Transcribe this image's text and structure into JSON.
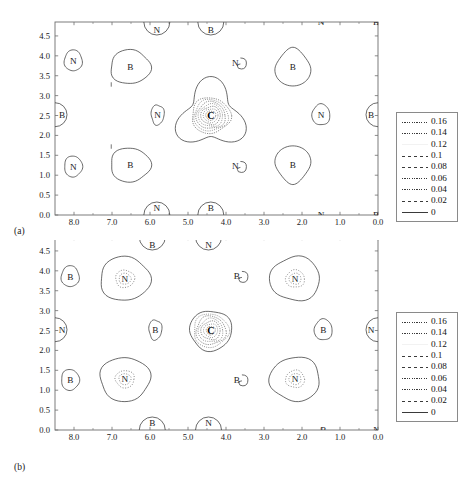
{
  "figure": {
    "type": "contour-plot-figure",
    "panels": [
      {
        "caption": "(a)",
        "center_atom": "C",
        "x_axis": {
          "ticks": [
            "8.0",
            "7.0",
            "6.0",
            "5.0",
            "4.0",
            "3.0",
            "2.0",
            "1.0",
            "0.0"
          ],
          "values": [
            8.0,
            7.0,
            6.0,
            5.0,
            4.0,
            3.0,
            2.0,
            1.0,
            0.0
          ],
          "min": 0.0,
          "max": 8.5,
          "reversed": true
        },
        "y_axis": {
          "ticks": [
            "0.0",
            "0.5",
            "1.0",
            "1.5",
            "2.0",
            "2.5",
            "3.0",
            "3.5",
            "4.0",
            "4.5"
          ],
          "values": [
            0.0,
            0.5,
            1.0,
            1.5,
            2.0,
            2.5,
            3.0,
            3.5,
            4.0,
            4.5
          ],
          "min": 0.0,
          "max": 4.85
        },
        "atoms": [
          {
            "label": "N",
            "x": 8.02,
            "y": 3.88,
            "shape": "small-round"
          },
          {
            "label": "B",
            "x": 6.52,
            "y": 3.72,
            "shape": "blob"
          },
          {
            "label": "N",
            "x": 5.8,
            "y": 2.52,
            "shape": "small-oval"
          },
          {
            "label": "C",
            "x": 4.4,
            "y": 2.5,
            "shape": "center-triangle"
          },
          {
            "label": "N",
            "x": 3.7,
            "y": 3.82,
            "shape": "tiny-hook"
          },
          {
            "label": "B",
            "x": 2.24,
            "y": 3.72,
            "shape": "teardrop-up"
          },
          {
            "label": "N",
            "x": 1.5,
            "y": 2.52,
            "shape": "small-round"
          },
          {
            "label": "B",
            "x": 0.05,
            "y": 2.52,
            "shape": "edge-right"
          },
          {
            "label": "N",
            "x": 8.02,
            "y": 1.22,
            "shape": "small-round"
          },
          {
            "label": "B",
            "x": 6.52,
            "y": 1.26,
            "shape": "blob"
          },
          {
            "label": "N",
            "x": 3.7,
            "y": 1.22,
            "shape": "tiny-hook"
          },
          {
            "label": "B",
            "x": 2.24,
            "y": 1.26,
            "shape": "teardrop-down"
          },
          {
            "label": "N",
            "x": 5.82,
            "y": 4.85,
            "shape": "edge-top"
          },
          {
            "label": "B",
            "x": 4.4,
            "y": 4.85,
            "shape": "edge-top"
          },
          {
            "label": "N",
            "x": 1.5,
            "y": 4.85,
            "shape": "bare"
          },
          {
            "label": "B",
            "x": 0.05,
            "y": 4.85,
            "shape": "bare"
          },
          {
            "label": "N",
            "x": 5.82,
            "y": 0.0,
            "shape": "edge-bottom"
          },
          {
            "label": "B",
            "x": 4.4,
            "y": 0.0,
            "shape": "edge-bottom"
          },
          {
            "label": "N",
            "x": 1.5,
            "y": 0.0,
            "shape": "bare"
          },
          {
            "label": "B",
            "x": 0.05,
            "y": 0.0,
            "shape": "bare"
          },
          {
            "label": "B",
            "x": 8.52,
            "y": 2.52,
            "shape": "edge-left"
          }
        ]
      },
      {
        "caption": "(b)",
        "center_atom": "C",
        "x_axis": {
          "ticks": [
            "8.0",
            "7.0",
            "6.0",
            "5.0",
            "4.0",
            "3.0",
            "2.0",
            "1.0",
            "0.0"
          ],
          "values": [
            8.0,
            7.0,
            6.0,
            5.0,
            4.0,
            3.0,
            2.0,
            1.0,
            0.0
          ],
          "min": 0.0,
          "max": 8.5,
          "reversed": true
        },
        "y_axis": {
          "ticks": [
            "0.0",
            "0.5",
            "1.0",
            "1.5",
            "2.0",
            "2.5",
            "3.0",
            "3.5",
            "4.0",
            "4.5"
          ],
          "values": [
            0.0,
            0.5,
            1.0,
            1.5,
            2.0,
            2.5,
            3.0,
            3.5,
            4.0,
            4.5
          ],
          "min": 0.0,
          "max": 4.85
        },
        "atoms": [
          {
            "label": "B",
            "x": 8.1,
            "y": 3.86,
            "shape": "small-round"
          },
          {
            "label": "N",
            "x": 6.66,
            "y": 3.8,
            "shape": "big-round-dotted"
          },
          {
            "label": "B",
            "x": 5.86,
            "y": 2.52,
            "shape": "small-oval"
          },
          {
            "label": "C",
            "x": 4.4,
            "y": 2.5,
            "shape": "center-round-dotted"
          },
          {
            "label": "B",
            "x": 3.66,
            "y": 3.86,
            "shape": "tiny-hook"
          },
          {
            "label": "N",
            "x": 2.18,
            "y": 3.8,
            "shape": "big-round-dotted"
          },
          {
            "label": "B",
            "x": 1.44,
            "y": 2.52,
            "shape": "small-round"
          },
          {
            "label": "N",
            "x": 0.04,
            "y": 2.52,
            "shape": "edge-right"
          },
          {
            "label": "B",
            "x": 8.1,
            "y": 1.26,
            "shape": "small-round"
          },
          {
            "label": "N",
            "x": 6.66,
            "y": 1.28,
            "shape": "big-round-dotted"
          },
          {
            "label": "B",
            "x": 3.66,
            "y": 1.26,
            "shape": "tiny-hook"
          },
          {
            "label": "N",
            "x": 2.18,
            "y": 1.28,
            "shape": "big-round-dotted"
          },
          {
            "label": "B",
            "x": 5.94,
            "y": 4.85,
            "shape": "edge-top"
          },
          {
            "label": "N",
            "x": 4.46,
            "y": 4.85,
            "shape": "edge-top"
          },
          {
            "label": "B",
            "x": 2.1,
            "y": 4.85,
            "shape": "bare"
          },
          {
            "label": "N",
            "x": 0.04,
            "y": 4.85,
            "shape": "bare"
          },
          {
            "label": "B",
            "x": 5.94,
            "y": 0.0,
            "shape": "edge-bottom"
          },
          {
            "label": "N",
            "x": 4.46,
            "y": 0.0,
            "shape": "edge-bottom"
          },
          {
            "label": "B",
            "x": 1.44,
            "y": 0.0,
            "shape": "bare"
          },
          {
            "label": "N",
            "x": 0.04,
            "y": 0.0,
            "shape": "bare"
          },
          {
            "label": "N",
            "x": 8.52,
            "y": 2.52,
            "shape": "edge-left"
          }
        ]
      }
    ],
    "legend": {
      "entries": [
        {
          "label": "0.16",
          "style": "dotted-fine"
        },
        {
          "label": "0.14",
          "style": "dotted-fine"
        },
        {
          "label": "0.12",
          "style": "blank"
        },
        {
          "label": "0.1",
          "style": "dashdot"
        },
        {
          "label": "0.08",
          "style": "dashdot"
        },
        {
          "label": "0.06",
          "style": "dotted"
        },
        {
          "label": "0.04",
          "style": "dotted-sparse"
        },
        {
          "label": "0.02",
          "style": "dashdot-long"
        },
        {
          "label": "0",
          "style": "solid"
        }
      ]
    },
    "colors": {
      "line": "#3a3a3a",
      "frame": "#6e6e6e",
      "text": "#111111",
      "background": "#ffffff"
    }
  },
  "chart_data": {
    "type": "line",
    "title": "",
    "subtitle": "",
    "xlabel": "",
    "ylabel": "",
    "grid": false,
    "legend_position": "right-outside",
    "xlim": [
      8.5,
      0.0
    ],
    "ylim": [
      0.0,
      4.85
    ],
    "xticks": [
      8.0,
      7.0,
      6.0,
      5.0,
      4.0,
      3.0,
      2.0,
      1.0,
      0.0
    ],
    "yticks": [
      0.0,
      0.5,
      1.0,
      1.5,
      2.0,
      2.5,
      3.0,
      3.5,
      4.0,
      4.5
    ],
    "contour_levels": [
      0,
      0.02,
      0.04,
      0.06,
      0.08,
      0.1,
      0.12,
      0.14,
      0.16
    ],
    "legend_entries": [
      "0.16",
      "0.14",
      "0.12",
      "0.1",
      "0.08",
      "0.06",
      "0.04",
      "0.02",
      "0"
    ],
    "panels": [
      {
        "name": "(a)",
        "atom_sites": [
          {
            "species": "N",
            "x": 8.02,
            "y": 3.88
          },
          {
            "species": "B",
            "x": 6.52,
            "y": 3.72
          },
          {
            "species": "N",
            "x": 5.8,
            "y": 2.52
          },
          {
            "species": "C",
            "x": 4.4,
            "y": 2.5
          },
          {
            "species": "N",
            "x": 3.7,
            "y": 3.82
          },
          {
            "species": "B",
            "x": 2.24,
            "y": 3.72
          },
          {
            "species": "N",
            "x": 1.5,
            "y": 2.52
          },
          {
            "species": "B",
            "x": 0.05,
            "y": 2.52
          },
          {
            "species": "N",
            "x": 8.02,
            "y": 1.22
          },
          {
            "species": "B",
            "x": 6.52,
            "y": 1.26
          },
          {
            "species": "N",
            "x": 3.7,
            "y": 1.22
          },
          {
            "species": "B",
            "x": 2.24,
            "y": 1.26
          },
          {
            "species": "N",
            "x": 5.82,
            "y": 4.85
          },
          {
            "species": "B",
            "x": 4.4,
            "y": 4.85
          },
          {
            "species": "N",
            "x": 1.5,
            "y": 4.85
          },
          {
            "species": "B",
            "x": 0.05,
            "y": 4.85
          },
          {
            "species": "N",
            "x": 5.82,
            "y": 0.0
          },
          {
            "species": "B",
            "x": 4.4,
            "y": 0.0
          },
          {
            "species": "N",
            "x": 1.5,
            "y": 0.0
          },
          {
            "species": "B",
            "x": 0.05,
            "y": 0.0
          }
        ]
      },
      {
        "name": "(b)",
        "atom_sites": [
          {
            "species": "B",
            "x": 8.1,
            "y": 3.86
          },
          {
            "species": "N",
            "x": 6.66,
            "y": 3.8
          },
          {
            "species": "B",
            "x": 5.86,
            "y": 2.52
          },
          {
            "species": "C",
            "x": 4.4,
            "y": 2.5
          },
          {
            "species": "B",
            "x": 3.66,
            "y": 3.86
          },
          {
            "species": "N",
            "x": 2.18,
            "y": 3.8
          },
          {
            "species": "B",
            "x": 1.44,
            "y": 2.52
          },
          {
            "species": "N",
            "x": 0.04,
            "y": 2.52
          },
          {
            "species": "B",
            "x": 8.1,
            "y": 1.26
          },
          {
            "species": "N",
            "x": 6.66,
            "y": 1.28
          },
          {
            "species": "B",
            "x": 3.66,
            "y": 1.26
          },
          {
            "species": "N",
            "x": 2.18,
            "y": 1.28
          },
          {
            "species": "B",
            "x": 5.94,
            "y": 4.85
          },
          {
            "species": "N",
            "x": 4.46,
            "y": 4.85
          },
          {
            "species": "B",
            "x": 2.1,
            "y": 4.85
          },
          {
            "species": "N",
            "x": 0.04,
            "y": 4.85
          },
          {
            "species": "B",
            "x": 5.94,
            "y": 0.0
          },
          {
            "species": "N",
            "x": 4.46,
            "y": 0.0
          },
          {
            "species": "B",
            "x": 1.44,
            "y": 0.0
          },
          {
            "species": "N",
            "x": 0.04,
            "y": 0.0
          }
        ]
      }
    ]
  }
}
